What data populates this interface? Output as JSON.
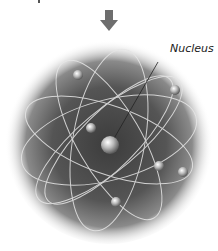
{
  "diagram": {
    "labels": {
      "nucleus": "Nucleus"
    },
    "colors": {
      "arrow": "#6e6e6e",
      "sphere_dark": "#3a3a3a",
      "sphere_light": "#e8e8e8",
      "orbit": "#e6e6e6"
    }
  }
}
